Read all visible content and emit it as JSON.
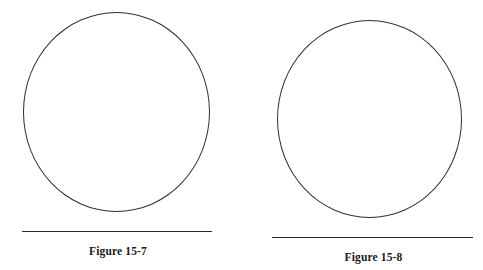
{
  "page": {
    "background_color": "#ffffff",
    "width": 483,
    "height": 270
  },
  "figures": [
    {
      "id": "figure-15-7",
      "caption": "Figure 15-7",
      "shape": "circle",
      "shape_name": "circle-outline",
      "stroke_color": "#303030",
      "fill_color": "transparent",
      "has_baseline_rule": true,
      "baseline_rule_color": "#2b2b2b"
    },
    {
      "id": "figure-15-8",
      "caption": "Figure 15-8",
      "shape": "circle",
      "shape_name": "circle-outline",
      "stroke_color": "#303030",
      "fill_color": "transparent",
      "has_baseline_rule": true,
      "baseline_rule_color": "#2b2b2b"
    }
  ]
}
